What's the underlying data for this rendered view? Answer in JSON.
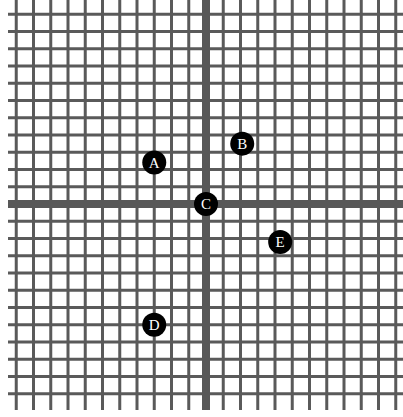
{
  "diagram": {
    "type": "coordinate-grid",
    "grid": {
      "line_color": "#5a5a5a",
      "axis_color": "#585858",
      "spacing_px": 17.25,
      "x_start": 14,
      "x_end": 401,
      "y_start": 6,
      "y_end": 407,
      "origin_px": {
        "x": 206,
        "y": 204
      }
    },
    "points": [
      {
        "label": "A",
        "x": -3,
        "y": 2.4
      },
      {
        "label": "B",
        "x": 2.1,
        "y": 3.5
      },
      {
        "label": "C",
        "x": 0,
        "y": 0
      },
      {
        "label": "D",
        "x": -3,
        "y": -7
      },
      {
        "label": "E",
        "x": 4.3,
        "y": -2.2
      }
    ],
    "point_style": {
      "fill": "#000000",
      "label_color": "#ffffff",
      "radius_px": 12
    }
  }
}
